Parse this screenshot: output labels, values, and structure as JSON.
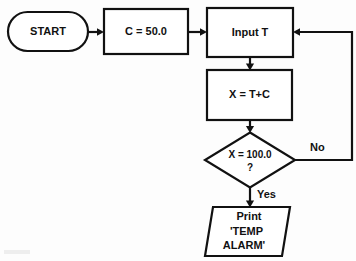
{
  "diagram": {
    "type": "flowchart",
    "orientation": "top-down with feedback loop",
    "colors": {
      "background": "#fdfdfd",
      "stroke": "#111111",
      "shape_fill": "#ffffff",
      "text": "#111111"
    },
    "nodes": [
      {
        "id": "start",
        "shape": "terminator",
        "label": "START",
        "font_size": 11
      },
      {
        "id": "set-constant",
        "shape": "process",
        "label": "C = 50.0",
        "font_size": 11
      },
      {
        "id": "input-temp",
        "shape": "process",
        "label": "Input T",
        "font_size": 11
      },
      {
        "id": "compute-x",
        "shape": "process",
        "label": "X = T+C",
        "font_size": 11
      },
      {
        "id": "decision-threshold",
        "shape": "decision",
        "label_line1": "X = 100.0",
        "label_line2": "?",
        "font_size": 10
      },
      {
        "id": "print-alarm",
        "shape": "output-parallelogram",
        "label_line1": "Print",
        "label_line2": "'TEMP",
        "label_line3": "ALARM'",
        "font_size": 11
      }
    ],
    "edges": [
      {
        "id": "start-to-constant",
        "from": "start",
        "to": "set-constant",
        "label": ""
      },
      {
        "id": "constant-to-input",
        "from": "set-constant",
        "to": "input-temp",
        "label": ""
      },
      {
        "id": "input-to-compute",
        "from": "input-temp",
        "to": "compute-x",
        "label": ""
      },
      {
        "id": "compute-to-decision",
        "from": "compute-x",
        "to": "decision-threshold",
        "label": ""
      },
      {
        "id": "decision-no-loop",
        "from": "decision-threshold",
        "to": "input-temp",
        "label": "No"
      },
      {
        "id": "decision-yes",
        "from": "decision-threshold",
        "to": "print-alarm",
        "label": "Yes"
      }
    ],
    "branch_labels": {
      "no": "No",
      "yes": "Yes"
    }
  }
}
